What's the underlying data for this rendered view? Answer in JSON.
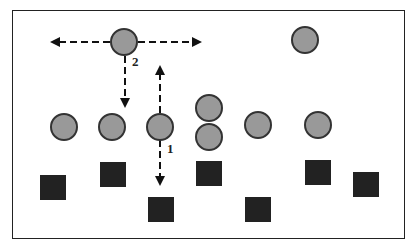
{
  "diagram": {
    "colors": {
      "player": "#999999",
      "player_stroke": "#333333",
      "opponent": "#222222",
      "arrow": "#111111",
      "frame": "#222222"
    },
    "labels": [
      {
        "id": "label-2",
        "text": "2"
      },
      {
        "id": "label-1",
        "text": "1"
      }
    ],
    "players": [
      {
        "id": "p-top-left",
        "role": "circle"
      },
      {
        "id": "p-top-right",
        "role": "circle"
      },
      {
        "id": "p-row-1",
        "role": "circle"
      },
      {
        "id": "p-row-2",
        "role": "circle"
      },
      {
        "id": "p-row-3",
        "role": "circle"
      },
      {
        "id": "p-stack-top",
        "role": "circle"
      },
      {
        "id": "p-stack-bottom",
        "role": "circle"
      },
      {
        "id": "p-row-5",
        "role": "circle"
      },
      {
        "id": "p-row-6",
        "role": "circle"
      }
    ],
    "opponents": [
      "s1",
      "s2",
      "s3",
      "s4",
      "s5",
      "s6",
      "s7"
    ],
    "arrows": [
      {
        "id": "arrow-left",
        "from": "p-top-left",
        "dir": "left"
      },
      {
        "id": "arrow-right",
        "from": "p-top-left",
        "dir": "right"
      },
      {
        "id": "arrow-down-2",
        "from": "p-top-left",
        "dir": "down"
      },
      {
        "id": "arrow-up-1",
        "from": "p-row-3",
        "dir": "up"
      },
      {
        "id": "arrow-down-1",
        "from": "p-row-3",
        "dir": "down"
      }
    ]
  }
}
